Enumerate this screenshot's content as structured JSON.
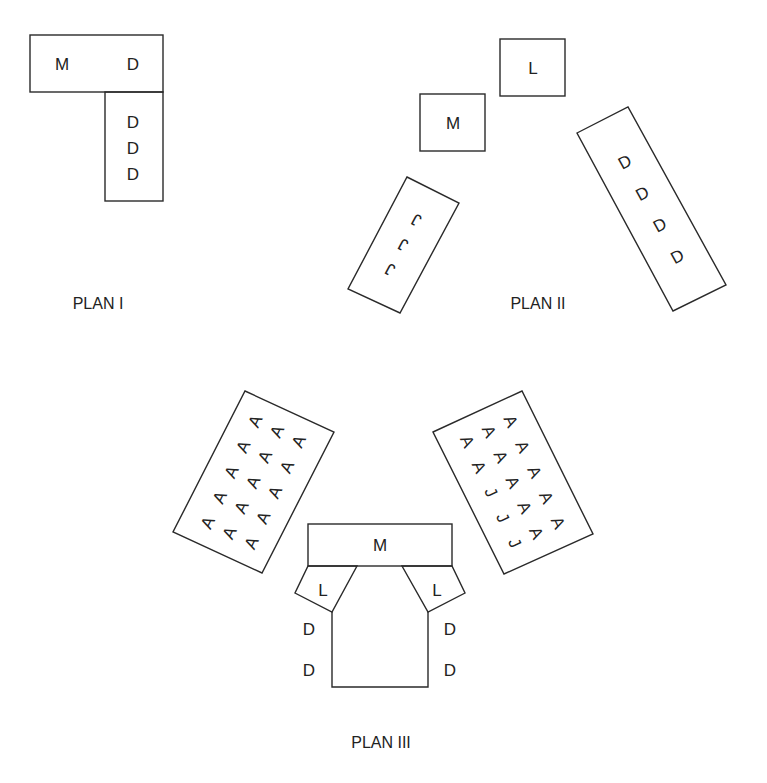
{
  "plans": [
    {
      "caption": "PLAN I",
      "top_block": {
        "left": "M",
        "right": "D"
      },
      "side_block": [
        "D",
        "D",
        "D"
      ]
    },
    {
      "caption": "PLAN II",
      "l_box": "L",
      "m_box": "M",
      "j_block": [
        "J",
        "J",
        "J"
      ],
      "d_block": [
        "D",
        "D",
        "D",
        "D"
      ]
    },
    {
      "caption": "PLAN III",
      "m_block": "M",
      "left_l": "L",
      "right_l": "L",
      "left_d": [
        "D",
        "D"
      ],
      "right_d": [
        "D",
        "D"
      ],
      "left_a_block": {
        "rows": [
          [
            "A",
            "A",
            "A"
          ],
          [
            "A",
            "A",
            "A"
          ],
          [
            "A",
            "A",
            "A"
          ],
          [
            "A",
            "A",
            "A"
          ],
          [
            "A",
            "A",
            "A"
          ]
        ]
      },
      "right_a_block": {
        "rows": [
          [
            "A",
            "A",
            "A"
          ],
          [
            "A",
            "A",
            "A"
          ],
          [
            "J",
            "A",
            "A"
          ],
          [
            "J",
            "A",
            "A"
          ],
          [
            "J",
            "A",
            "A"
          ]
        ]
      }
    }
  ]
}
